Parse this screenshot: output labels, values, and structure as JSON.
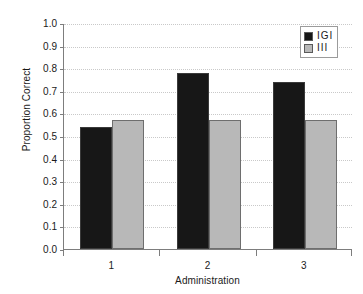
{
  "chart_data": {
    "type": "bar",
    "title": "",
    "subtitle": "",
    "xlabel": "Administration",
    "ylabel": "Proportion Correct",
    "categories": [
      "1",
      "2",
      "3"
    ],
    "series": [
      {
        "name": "IGI",
        "color": "#171717",
        "values": [
          0.54,
          0.78,
          0.74
        ]
      },
      {
        "name": "III",
        "color": "#b8b8b8",
        "values": [
          0.57,
          0.57,
          0.57
        ]
      }
    ],
    "ylim": [
      0.0,
      1.0
    ],
    "ytick_step": 0.1,
    "ytick_labels": [
      "1.0",
      "0.9",
      "0.8",
      "0.7",
      "0.6",
      "0.5",
      "0.4",
      "0.3",
      "0.2",
      "0.1",
      "0.0"
    ],
    "ytick_values": [
      1.0,
      0.9,
      0.8,
      0.7,
      0.6,
      0.5,
      0.4,
      0.3,
      0.2,
      0.1,
      0.0
    ],
    "grid": "horizontal-dotted",
    "legend_position": "top-right",
    "annotations": []
  },
  "legend": {
    "entries": [
      {
        "label": "IGI",
        "color": "#171717"
      },
      {
        "label": "III",
        "color": "#b8b8b8"
      }
    ]
  },
  "axes": {
    "y_title": "Proportion Correct",
    "x_title": "Administration"
  },
  "colors": {
    "series_dark": "#171717",
    "series_light": "#b8b8b8",
    "axis": "#7d7d7d",
    "grid": "#c9c9c9",
    "text": "#1a1a1a",
    "background": "#ffffff"
  }
}
